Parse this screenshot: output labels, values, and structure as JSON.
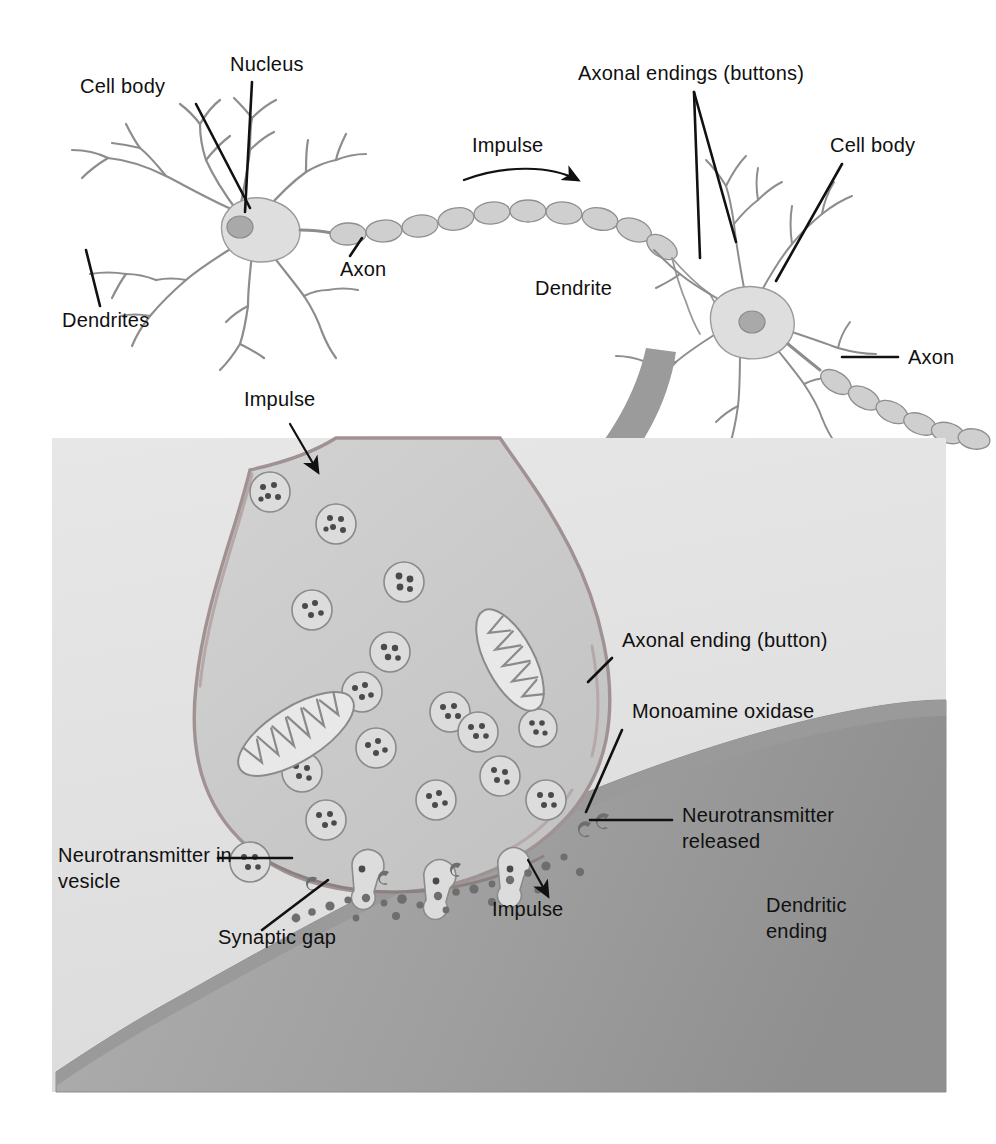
{
  "figure": {
    "background_color": "#ffffff",
    "panel_background_color": "#e3e3e3",
    "label_color": "#101010",
    "membrane_color": "#a6a6a6",
    "terminal_fill_color": "#cccccc",
    "arrow_color": "#9b9b9b"
  },
  "top_panel": {
    "name": "two-neuron-overview",
    "labels": {
      "cell_body_left": "Cell body",
      "nucleus": "Nucleus",
      "dendrites": "Dendrites",
      "axon_left": "Axon",
      "impulse": "Impulse",
      "axonal_endings": "Axonal endings (buttons)",
      "dendrite_right": "Dendrite",
      "cell_body_right": "Cell body",
      "axon_right": "Axon"
    }
  },
  "bottom_panel": {
    "name": "synapse-detail",
    "labels": {
      "impulse_top": "Impulse",
      "axonal_ending": "Axonal ending (button)",
      "monoamine_oxidase": "Monoamine oxidase",
      "neurotransmitter_released": "Neurotransmitter released",
      "neurotransmitter_in_vesicle": "Neurotransmitter in vesicle",
      "synaptic_gap": "Synaptic gap",
      "impulse_bottom": "Impulse",
      "dendritic_ending": "Dendritic ending"
    },
    "structures": {
      "vesicle_count": 16,
      "mitochondria_count": 2,
      "release_site_count": 3
    }
  },
  "icons": {
    "impulse_arrow": "curved-arrow-icon",
    "zoom_arrow": "magnify-arrow-icon",
    "leader_line": "leader-line-icon"
  }
}
